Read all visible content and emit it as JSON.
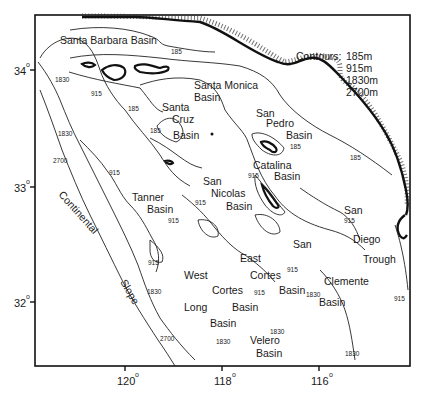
{
  "map": {
    "frame": {
      "left": 35,
      "top": 15,
      "right": 410,
      "bottom": 366
    },
    "legend": {
      "title": "Contours:",
      "items": [
        "185m",
        "915m",
        "1830m",
        "2700m"
      ]
    },
    "axes": {
      "x_ticks": [
        {
          "label": "120",
          "x": 125
        },
        {
          "label": "118",
          "x": 222
        },
        {
          "label": "116",
          "x": 319
        }
      ],
      "y_ticks": [
        {
          "label": "34",
          "y": 70
        },
        {
          "label": "33",
          "y": 187
        },
        {
          "label": "32",
          "y": 302
        }
      ],
      "degree_symbol": "o"
    },
    "features": {
      "santa_barbara_basin": "Santa Barbara Basin",
      "santa_monica": "Santa Monica",
      "santa_monica_basin": "Basin",
      "san_pedro_1": "San",
      "san_pedro_2": "Pedro",
      "san_pedro_3": "Basin",
      "santa_cruz_1": "Santa",
      "santa_cruz_2": "Cruz",
      "santa_cruz_3": "Basin",
      "catalina_1": "Catalina",
      "catalina_2": "Basin",
      "san_nicolas_1": "San",
      "san_nicolas_2": "Nicolas",
      "san_nicolas_3": "Basin",
      "tanner_1": "Tanner",
      "tanner_2": "Basin",
      "continental": "Continental",
      "slope": "Slope",
      "west_cortes_1": "West",
      "west_cortes_2": "Cortes",
      "west_cortes_3": "Basin",
      "east_cortes_1": "East",
      "east_cortes_2": "Cortes",
      "east_cortes_3": "Basin",
      "long_1": "Long",
      "long_2": "Basin",
      "velero_1": "Velero",
      "velero_2": "Basin",
      "san_clemente_1": "San",
      "san_clemente_2": "Clemente",
      "san_clemente_3": "Basin",
      "san_diego_1": "San",
      "san_diego_2": "Diego",
      "san_diego_3": "Trough"
    },
    "contour_labels": [
      {
        "text": "185",
        "x": 171,
        "y": 54
      },
      {
        "text": "1830",
        "x": 55,
        "y": 82
      },
      {
        "text": "915",
        "x": 91,
        "y": 96
      },
      {
        "text": "185",
        "x": 128,
        "y": 111
      },
      {
        "text": "185",
        "x": 150,
        "y": 133
      },
      {
        "text": "1830",
        "x": 58,
        "y": 136
      },
      {
        "text": "2700",
        "x": 53,
        "y": 163
      },
      {
        "text": "915",
        "x": 109,
        "y": 175
      },
      {
        "text": "185",
        "x": 290,
        "y": 149
      },
      {
        "text": "185",
        "x": 350,
        "y": 160
      },
      {
        "text": "915",
        "x": 248,
        "y": 178
      },
      {
        "text": "915",
        "x": 97,
        "y": 218
      },
      {
        "text": "915",
        "x": 168,
        "y": 223
      },
      {
        "text": "915",
        "x": 148,
        "y": 265
      },
      {
        "text": "915",
        "x": 195,
        "y": 205
      },
      {
        "text": "915",
        "x": 344,
        "y": 223
      },
      {
        "text": "915",
        "x": 287,
        "y": 272
      },
      {
        "text": "1830",
        "x": 147,
        "y": 294
      },
      {
        "text": "915",
        "x": 254,
        "y": 295
      },
      {
        "text": "1830",
        "x": 306,
        "y": 297
      },
      {
        "text": "915",
        "x": 394,
        "y": 301
      },
      {
        "text": "1830",
        "x": 215,
        "y": 338
      },
      {
        "text": "2700",
        "x": 160,
        "y": 341
      },
      {
        "text": "1830",
        "x": 272,
        "y": 333
      },
      {
        "text": "1830",
        "x": 216,
        "y": 344
      },
      {
        "text": "1830",
        "x": 345,
        "y": 356
      }
    ]
  }
}
